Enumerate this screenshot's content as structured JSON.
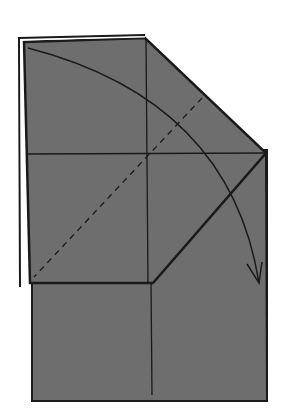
{
  "diagram": {
    "type": "origami-step",
    "width": 291,
    "height": 414,
    "colors": {
      "background": "#ffffff",
      "paper": "#6e6e6e",
      "line": "#1a1a1a",
      "highlight": "#ffffff"
    },
    "base_rect": {
      "x": 32,
      "y": 150,
      "width": 235,
      "height": 251
    },
    "flap_polygon": "25,42 145,38 266,153 153,283 30,283",
    "flap_outline_white": "20,38 145,36",
    "creases": {
      "vertical": {
        "x1": 147,
        "y1": 40,
        "x2": 149,
        "y2": 395
      },
      "horizontal": {
        "x1": 27,
        "y1": 154,
        "x2": 266,
        "y2": 153
      }
    },
    "valley_fold_dashed": {
      "x1": 202,
      "y1": 98,
      "x2": 34,
      "y2": 277
    },
    "fold_arrow": {
      "path": "M 28 48 Q 230 100 259 283",
      "head": "247,264 259,283 262,262"
    }
  }
}
